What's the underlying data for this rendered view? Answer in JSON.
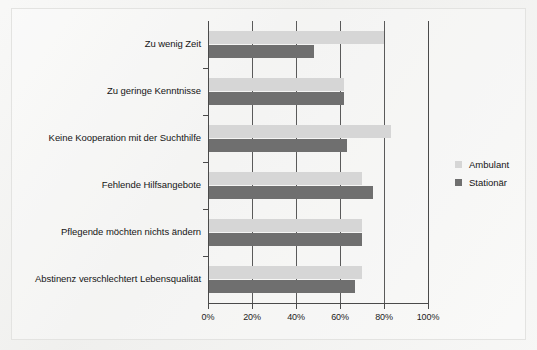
{
  "chart_data": {
    "type": "bar",
    "orientation": "horizontal",
    "title": "",
    "subtitle": "",
    "xlabel": "",
    "ylabel": "",
    "xlim": [
      0,
      100
    ],
    "grid": true,
    "legend_position": "right",
    "categories": [
      "Zu wenig Zeit",
      "Zu geringe Kenntnisse",
      "Keine Kooperation mit der Suchthilfe",
      "Fehlende Hilfsangebote",
      "Pflegende möchten nichts ändern",
      "Abstinenz verschlechtert Lebensqualität"
    ],
    "series": [
      {
        "name": "Ambulant",
        "color": "#d6d6d6",
        "values": [
          80,
          62,
          83,
          70,
          70,
          70
        ]
      },
      {
        "name": "Stationär",
        "color": "#6f6f6f",
        "values": [
          48,
          62,
          63,
          75,
          70,
          67
        ]
      }
    ],
    "xticks": [
      0,
      20,
      40,
      60,
      80,
      100
    ],
    "xtick_labels": [
      "0%",
      "20%",
      "40%",
      "60%",
      "80%",
      "100%"
    ]
  },
  "legend": {
    "entries": [
      {
        "label": "Ambulant",
        "color": "#d6d6d6",
        "swatch_name": "legend-swatch-ambulant"
      },
      {
        "label": "Stationär",
        "color": "#6f6f6f",
        "swatch_name": "legend-swatch-stationaer"
      }
    ]
  },
  "colors": {
    "ambulant": "#d6d6d6",
    "stationaer": "#6f6f6f",
    "axis": "#4a4a4a",
    "text": "#151515",
    "background": "#f0f0ee"
  }
}
